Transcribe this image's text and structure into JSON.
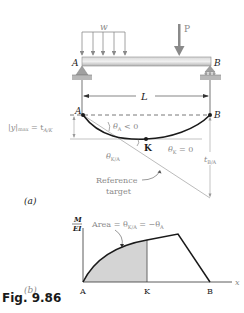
{
  "figure": {
    "caption": "Fig. 9.86",
    "part_a_label": "(a)",
    "part_b_label": "(b)"
  },
  "beam": {
    "load_distributed_label": "w",
    "load_point_label": "P",
    "support_left_label": "A",
    "support_right_label": "B",
    "span_label": "L"
  },
  "deflection": {
    "left_point_label": "A",
    "right_point_label": "B",
    "max_point_label": "K",
    "ymax_label": "|y|max = tA/K",
    "ymax_label_main": "|y|",
    "ymax_label_sub": "max",
    "ymax_label_eq": " = t",
    "ymax_label_eq_sub": "A/K",
    "theta_a_main": "θ",
    "theta_a_sub": "A",
    "theta_a_rest": " < 0",
    "theta_k_main": "θ",
    "theta_k_sub": "K",
    "theta_k_rest": " = 0",
    "theta_ka_main": "θ",
    "theta_ka_sub": "K/A",
    "t_ba_main": "t",
    "t_ba_sub": "B/A",
    "reference_line1": "Reference",
    "reference_line2": "target"
  },
  "moment_diagram": {
    "y_axis_numerator": "M",
    "y_axis_denominator": "EI",
    "x_axis_label": "x",
    "area_label_prefix": "Area = θ",
    "area_label_sub1": "K/A",
    "area_label_mid": " = −θ",
    "area_label_sub2": "A",
    "x_ticks": [
      "A",
      "K",
      "B"
    ]
  },
  "colors": {
    "beam_fill": "#c8c8c8",
    "support_fill": "#a0a0a0",
    "shaded_area": "#d4d4d4",
    "line_gray": "#9a9a9a",
    "curve_dark": "#1a1a1a"
  }
}
